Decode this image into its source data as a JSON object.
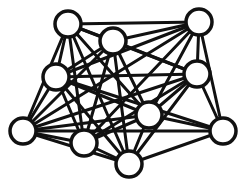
{
  "diagram": {
    "type": "network-graph",
    "colors": {
      "stroke": "#111111",
      "node_fill": "#ffffff",
      "background": "#ffffff"
    },
    "node_radius": 13,
    "nodes": [
      {
        "id": "A",
        "x": 68,
        "y": 24
      },
      {
        "id": "B",
        "x": 113,
        "y": 41
      },
      {
        "id": "C",
        "x": 199,
        "y": 22
      },
      {
        "id": "D",
        "x": 56,
        "y": 77
      },
      {
        "id": "E",
        "x": 197,
        "y": 74
      },
      {
        "id": "F",
        "x": 149,
        "y": 115
      },
      {
        "id": "G",
        "x": 23,
        "y": 131
      },
      {
        "id": "H",
        "x": 84,
        "y": 143
      },
      {
        "id": "I",
        "x": 129,
        "y": 164
      },
      {
        "id": "J",
        "x": 223,
        "y": 131
      }
    ],
    "edges": [
      [
        "A",
        "B"
      ],
      [
        "A",
        "C"
      ],
      [
        "A",
        "D"
      ],
      [
        "A",
        "G"
      ],
      [
        "A",
        "E"
      ],
      [
        "A",
        "F"
      ],
      [
        "A",
        "H"
      ],
      [
        "A",
        "I"
      ],
      [
        "B",
        "C"
      ],
      [
        "B",
        "D"
      ],
      [
        "B",
        "E"
      ],
      [
        "B",
        "F"
      ],
      [
        "B",
        "G"
      ],
      [
        "B",
        "H"
      ],
      [
        "B",
        "I"
      ],
      [
        "C",
        "E"
      ],
      [
        "C",
        "F"
      ],
      [
        "C",
        "J"
      ],
      [
        "C",
        "D"
      ],
      [
        "C",
        "H"
      ],
      [
        "C",
        "G"
      ],
      [
        "D",
        "E"
      ],
      [
        "D",
        "F"
      ],
      [
        "D",
        "G"
      ],
      [
        "D",
        "H"
      ],
      [
        "D",
        "I"
      ],
      [
        "D",
        "J"
      ],
      [
        "E",
        "F"
      ],
      [
        "E",
        "G"
      ],
      [
        "E",
        "H"
      ],
      [
        "E",
        "I"
      ],
      [
        "E",
        "J"
      ],
      [
        "F",
        "G"
      ],
      [
        "F",
        "H"
      ],
      [
        "F",
        "I"
      ],
      [
        "F",
        "J"
      ],
      [
        "G",
        "H"
      ],
      [
        "G",
        "I"
      ],
      [
        "G",
        "J"
      ],
      [
        "H",
        "I"
      ],
      [
        "I",
        "J"
      ]
    ]
  }
}
